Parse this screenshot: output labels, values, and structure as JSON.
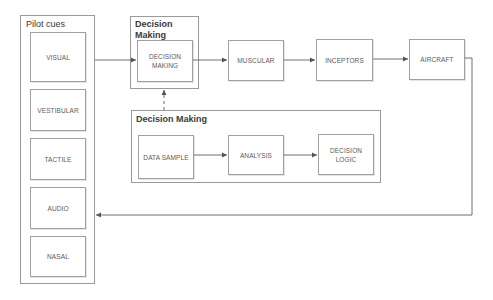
{
  "diagram": {
    "pilot_cues": {
      "title": "Pilot cues",
      "items": [
        "VISUAL",
        "VESTIBULAR",
        "TACTILE",
        "AUDIO",
        "NASAL"
      ]
    },
    "decision_making_top": {
      "title": "Decision Making",
      "inner": "DECISION MAKING"
    },
    "chain": [
      "MUSCULAR",
      "INCEPTORS",
      "AIRCRAFT"
    ],
    "decision_making_detail": {
      "title": "Decision Making",
      "steps": [
        "DATA SAMPLE",
        "ANALYSIS",
        "DECISION LOGIC"
      ]
    },
    "edges": [
      {
        "from": "VISUAL",
        "to": "DECISION MAKING",
        "style": "solid"
      },
      {
        "from": "DECISION MAKING",
        "to": "MUSCULAR",
        "style": "solid"
      },
      {
        "from": "MUSCULAR",
        "to": "INCEPTORS",
        "style": "solid"
      },
      {
        "from": "INCEPTORS",
        "to": "AIRCRAFT",
        "style": "solid"
      },
      {
        "from": "AIRCRAFT",
        "to": "Pilot cues",
        "style": "solid",
        "note": "feedback loop"
      },
      {
        "from": "Decision Making (detail)",
        "to": "Decision Making",
        "style": "dashed"
      },
      {
        "from": "DATA SAMPLE",
        "to": "ANALYSIS",
        "style": "solid"
      },
      {
        "from": "ANALYSIS",
        "to": "DECISION LOGIC",
        "style": "solid"
      }
    ],
    "colors": {
      "line": "#6e6e6e",
      "border": "#9a9a9a",
      "text": "#5a5a5a"
    }
  }
}
